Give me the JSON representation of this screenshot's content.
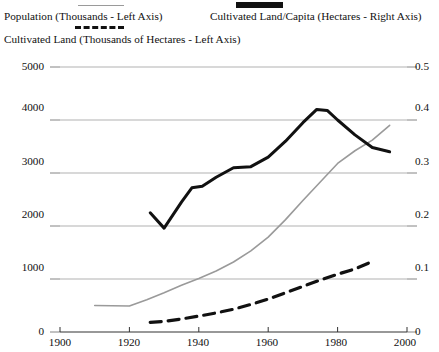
{
  "legend": {
    "population": {
      "label": "Population (Thousands - Left Axis)",
      "swatch": "thin-gray-line",
      "color": "#9a9a9a"
    },
    "percapita": {
      "label": "Cultivated Land/Capita (Hectares - Right Axis)",
      "swatch": "thick-black-line",
      "color": "#111111"
    },
    "cultivated": {
      "label": "Cultivated Land (Thousands of Hectares - Left Axis)",
      "swatch": "black-dashed-line",
      "color": "#111111"
    }
  },
  "axes": {
    "left_ticks": [
      "5000",
      "4000",
      "3000",
      "2000",
      "1000",
      "0"
    ],
    "right_ticks": [
      "0.5",
      "0.4",
      "0.3",
      "0.2",
      "0.1",
      "0"
    ],
    "x_ticks": [
      "1900",
      "1920",
      "1940",
      "1960",
      "1980",
      "2000"
    ]
  },
  "chart_data": {
    "type": "line",
    "title": "",
    "xlabel": "",
    "ylabel": "",
    "xlim": [
      1900,
      2000
    ],
    "ylim": [
      0,
      5000
    ],
    "ylim_right": [
      0,
      0.5
    ],
    "grid": true,
    "legend_position": "top",
    "series": [
      {
        "name": "Population (Thousands - Left Axis)",
        "axis": "left",
        "style": "thin-solid",
        "color": "#9a9a9a",
        "points": [
          [
            1910,
            500
          ],
          [
            1915,
            495
          ],
          [
            1920,
            490
          ],
          [
            1925,
            610
          ],
          [
            1930,
            740
          ],
          [
            1935,
            880
          ],
          [
            1940,
            1010
          ],
          [
            1945,
            1150
          ],
          [
            1950,
            1320
          ],
          [
            1955,
            1530
          ],
          [
            1960,
            1790
          ],
          [
            1965,
            2120
          ],
          [
            1970,
            2480
          ],
          [
            1975,
            2830
          ],
          [
            1980,
            3180
          ],
          [
            1985,
            3420
          ],
          [
            1990,
            3620
          ],
          [
            1995,
            3900
          ]
        ]
      },
      {
        "name": "Cultivated Land (Thousands of Hectares - Left Axis)",
        "axis": "left",
        "style": "dashed",
        "color": "#111111",
        "points": [
          [
            1926,
            180
          ],
          [
            1930,
            200
          ],
          [
            1935,
            245
          ],
          [
            1940,
            300
          ],
          [
            1945,
            360
          ],
          [
            1950,
            430
          ],
          [
            1955,
            520
          ],
          [
            1960,
            620
          ],
          [
            1965,
            740
          ],
          [
            1970,
            860
          ],
          [
            1975,
            980
          ],
          [
            1980,
            1090
          ],
          [
            1985,
            1190
          ],
          [
            1990,
            1330
          ]
        ]
      },
      {
        "name": "Cultivated Land/Capita (Hectares - Right Axis)",
        "axis": "right",
        "style": "thick-solid",
        "color": "#111111",
        "points": [
          [
            1926,
            0.225
          ],
          [
            1930,
            0.196
          ],
          [
            1935,
            0.245
          ],
          [
            1938,
            0.272
          ],
          [
            1941,
            0.275
          ],
          [
            1945,
            0.292
          ],
          [
            1950,
            0.31
          ],
          [
            1955,
            0.312
          ],
          [
            1960,
            0.33
          ],
          [
            1965,
            0.36
          ],
          [
            1970,
            0.395
          ],
          [
            1974,
            0.42
          ],
          [
            1977,
            0.418
          ],
          [
            1980,
            0.4
          ],
          [
            1985,
            0.372
          ],
          [
            1990,
            0.348
          ],
          [
            1995,
            0.34
          ]
        ]
      }
    ]
  }
}
